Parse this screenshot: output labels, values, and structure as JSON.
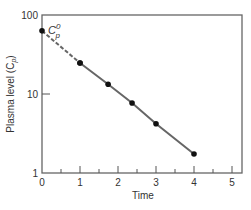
{
  "chart_data": {
    "type": "line",
    "title": "",
    "xlabel": "Time",
    "ylabel": "Plasma level (C",
    "ylabel_sub": "p",
    "ylabel_close": ")",
    "yscale": "log",
    "xlim": [
      0,
      5
    ],
    "ylim": [
      1,
      100
    ],
    "x_ticks": [
      "0",
      "1",
      "2",
      "3",
      "4",
      "5"
    ],
    "y_ticks": [
      "1",
      "10",
      "100"
    ],
    "grid": false,
    "legend": null,
    "series": [
      {
        "name": "Plasma level",
        "x": [
          1,
          1.74,
          2.37,
          3,
          4
        ],
        "values": [
          24.7,
          13.3,
          7.7,
          4.2,
          1.74
        ],
        "style": "solid",
        "markers": true
      },
      {
        "name": "Back-extrapolation",
        "x": [
          0,
          1
        ],
        "values": [
          63,
          24.7
        ],
        "style": "dashed",
        "markers": true
      }
    ],
    "annotations": [
      {
        "text": "C",
        "sub": "p",
        "sup": "0",
        "x": 0,
        "y": 63
      }
    ]
  },
  "colors": {
    "axis": "#555555",
    "line": "#666666",
    "marker": "#111111",
    "text": "#333333"
  }
}
